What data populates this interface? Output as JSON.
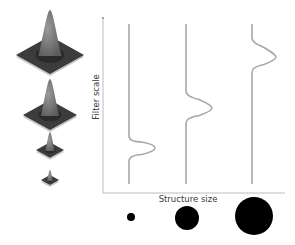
{
  "figure": {
    "y_axis_label": "Filter scale",
    "x_axis_label": "Structure size",
    "colors": {
      "axis": "#bdbdbd",
      "curve": "#a8a8a8",
      "circle": "#000000",
      "kernel_dark": "#3c3c3c",
      "kernel_mid": "#7a7a7a"
    }
  },
  "kernels": [
    {
      "name": "largest-filter",
      "cx": 50,
      "base_y": 55,
      "base_w": 68,
      "height": 45
    },
    {
      "name": "large-filter",
      "cx": 50,
      "base_y": 115,
      "base_w": 54,
      "height": 36
    },
    {
      "name": "medium-filter",
      "cx": 50,
      "base_y": 150,
      "base_w": 28,
      "height": 18
    },
    {
      "name": "small-filter",
      "cx": 50,
      "base_y": 180,
      "base_w": 18,
      "height": 10
    }
  ],
  "responses": [
    {
      "name": "small-structure-response",
      "baseline_x": 129,
      "peak_x": 155,
      "peak_y": 148,
      "bump_top": 136,
      "bump_bottom": 161
    },
    {
      "name": "medium-structure-response",
      "baseline_x": 186,
      "peak_x": 212,
      "peak_y": 108,
      "bump_top": 91,
      "bump_bottom": 123
    },
    {
      "name": "large-structure-response",
      "baseline_x": 252,
      "peak_x": 276,
      "peak_y": 57,
      "bump_top": 38,
      "bump_bottom": 72
    }
  ],
  "structures": [
    {
      "name": "small-structure",
      "cx": 131,
      "cy": 217,
      "r": 4
    },
    {
      "name": "medium-structure",
      "cx": 187,
      "cy": 218,
      "r": 12
    },
    {
      "name": "large-structure",
      "cx": 254,
      "cy": 216,
      "r": 19
    }
  ],
  "axes": {
    "origin_x": 103,
    "origin_y": 193,
    "top_y": 18,
    "right_x": 285,
    "curve_top": 24,
    "curve_bottom": 184
  }
}
